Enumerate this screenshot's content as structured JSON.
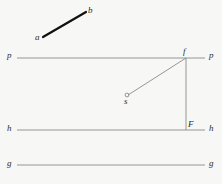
{
  "figure": {
    "background_color": "#f7f7f5",
    "width": 222,
    "height": 184,
    "line_color": "#8a8a8a",
    "segment_color": "#111111",
    "label_color": "#2b2b2b"
  },
  "labels": {
    "a": "a",
    "b": "b",
    "p_left": "p",
    "p_right": "p",
    "h_left": "h",
    "h_right": "h",
    "g_left": "g",
    "g_right": "g",
    "f": "f",
    "F": "F",
    "s": "s"
  },
  "geometry": {
    "segment_ab": {
      "name": "segment-ab",
      "x1": 43,
      "y1": 37,
      "x2": 86,
      "y2": 12,
      "stroke_width": 2.2,
      "color": "#111111"
    },
    "line_p": {
      "name": "line-p",
      "x1": 17,
      "y1": 58,
      "x2": 205,
      "y2": 58,
      "stroke_width": 0.9,
      "color": "#8a8a8a"
    },
    "line_h": {
      "name": "line-h",
      "x1": 17,
      "y1": 130,
      "x2": 205,
      "y2": 130,
      "stroke_width": 0.9,
      "color": "#8a8a8a"
    },
    "line_g": {
      "name": "line-g",
      "x1": 17,
      "y1": 165,
      "x2": 205,
      "y2": 165,
      "stroke_width": 0.9,
      "color": "#8a8a8a"
    },
    "vertical_fF": {
      "name": "vertical-line-f-to-F",
      "x1": 186,
      "y1": 58,
      "x2": 186,
      "y2": 130,
      "stroke_width": 0.9,
      "color": "#8a8a8a"
    },
    "diagonal_sf": {
      "name": "diagonal-line-s-to-f",
      "x1": 128,
      "y1": 95,
      "x2": 186,
      "y2": 58,
      "stroke_width": 0.9,
      "color": "#8a8a8a"
    },
    "point_s": {
      "name": "point-s",
      "cx": 127,
      "cy": 95,
      "r": 1.9,
      "color": "#8a8a8a"
    }
  },
  "label_positions": {
    "a": {
      "left": 35,
      "top": 33
    },
    "b": {
      "left": 88,
      "top": 6
    },
    "p_left": {
      "left": 7,
      "top": 51
    },
    "p_right": {
      "left": 209,
      "top": 51
    },
    "h_left": {
      "left": 7,
      "top": 124
    },
    "h_right": {
      "left": 209,
      "top": 124
    },
    "g_left": {
      "left": 7,
      "top": 159
    },
    "g_right": {
      "left": 209,
      "top": 159
    },
    "f": {
      "left": 183,
      "top": 47
    },
    "F": {
      "left": 188,
      "top": 120
    },
    "s": {
      "left": 124,
      "top": 97
    }
  }
}
